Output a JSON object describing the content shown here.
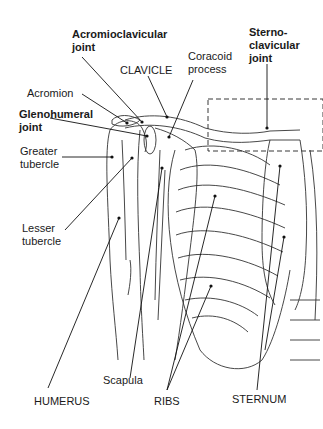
{
  "diagram": {
    "labels": {
      "acromioclavicular_joint": "Acromioclavicular\njoint",
      "clavicle": "CLAVICLE",
      "coracoid_process": "Coracoid\nprocess",
      "sternoclavicular_joint": "Sterno-\nclavicular\njoint",
      "acromion": "Acromion",
      "glenohumeral_joint": "Glenohumeral\njoint",
      "greater_tubercle": "Greater\ntubercle",
      "lesser_tubercle": "Lesser\ntubercle",
      "humerus": "HUMERUS",
      "scapula": "Scapula",
      "ribs": "RIBS",
      "sternum": "STERNUM"
    },
    "colors": {
      "line": "#1a1a1a",
      "background": "#ffffff"
    }
  }
}
